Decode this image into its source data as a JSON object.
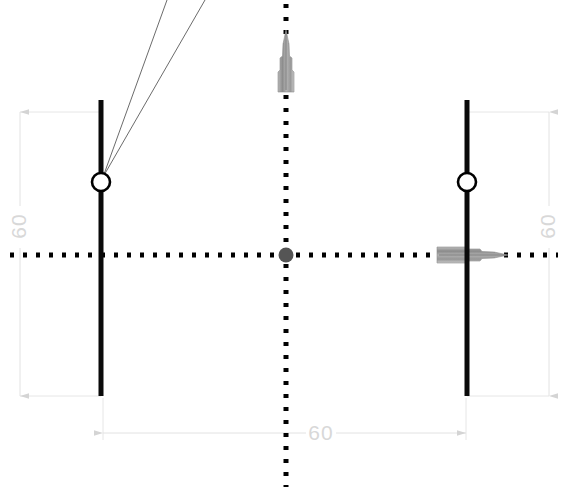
{
  "drawing": {
    "type": "technical-cad-measurement-view",
    "background_color": "#ffffff",
    "width": 568,
    "height": 494,
    "centerlines": {
      "color": "#000000",
      "style": "dotted",
      "horizontal": {
        "y": 255,
        "x_start": 10,
        "x_end": 558
      },
      "vertical": {
        "x": 286,
        "y_start": 4,
        "y_end": 486
      }
    },
    "origin_marker": {
      "name": "center-origin-point",
      "x": 286,
      "y": 255,
      "radius": 7,
      "color": "#555555"
    },
    "workpiece_bars": [
      {
        "name": "left-vertical-bar",
        "x": 101,
        "y_top": 100,
        "y_bottom": 396,
        "thickness": 5,
        "color": "#0a0a0a"
      },
      {
        "name": "right-vertical-bar",
        "x": 467,
        "y_top": 100,
        "y_bottom": 396,
        "thickness": 5,
        "color": "#0a0a0a"
      }
    ],
    "node_markers": [
      {
        "name": "left-node-circle",
        "x": 101,
        "y": 182,
        "radius": 9,
        "fill": "#ffffff",
        "stroke": "#000000"
      },
      {
        "name": "right-node-circle",
        "x": 467,
        "y": 182,
        "radius": 9,
        "fill": "#ffffff",
        "stroke": "#000000"
      }
    ],
    "leader_lines": {
      "name": "left-node-leader-lines",
      "color": "#555555",
      "origin_x": 103,
      "origin_y": 176,
      "targets": [
        {
          "x": 167,
          "y": 0
        },
        {
          "x": 205,
          "y": 0
        }
      ]
    },
    "tools": [
      {
        "name": "vertical-probe-tool",
        "orientation": "vertical",
        "tip_x": 286,
        "tip_y": 30,
        "base_y": 92,
        "color": "#9a9a9a"
      },
      {
        "name": "horizontal-probe-tool",
        "orientation": "horizontal",
        "tip_x": 508,
        "tip_y": 255,
        "base_x": 437,
        "color": "#9a9a9a"
      }
    ],
    "dimensions": [
      {
        "name": "dimension-left-vertical",
        "orientation": "vertical",
        "value": "60",
        "line_x": 20,
        "y_start": 112,
        "y_end": 396,
        "ext_from_x": 20,
        "ext_to_x": 101,
        "color": "#d8d8d8",
        "label_x": 20,
        "label_y": 226
      },
      {
        "name": "dimension-right-vertical",
        "orientation": "vertical",
        "value": "60",
        "line_x": 549,
        "y_start": 112,
        "y_end": 396,
        "ext_from_x": 549,
        "ext_to_x": 467,
        "color": "#d8d8d8",
        "label_x": 549,
        "label_y": 226
      },
      {
        "name": "dimension-bottom-horizontal",
        "orientation": "horizontal",
        "value": "60",
        "line_y": 433,
        "x_start": 103,
        "x_end": 466,
        "ext_from_y": 433,
        "ext_to_y": 398,
        "color": "#d8d8d8",
        "label_x": 320,
        "label_y": 433
      }
    ]
  }
}
